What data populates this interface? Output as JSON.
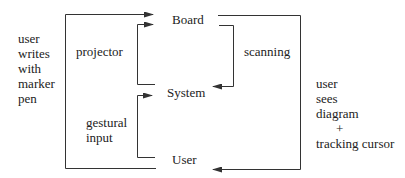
{
  "nodes": {
    "board": "Board",
    "system": "System",
    "user": "User"
  },
  "edges": {
    "projector": "projector",
    "scanning": "scanning",
    "gestural_input": [
      "gestural",
      "input"
    ]
  },
  "annotations": {
    "left": [
      "user",
      "writes",
      "with",
      "marker",
      "pen"
    ],
    "right": [
      "user",
      "sees",
      "diagram",
      "+",
      "tracking cursor"
    ]
  },
  "colors": {
    "line": "#333333",
    "text": "#222222",
    "background": "#ffffff"
  }
}
